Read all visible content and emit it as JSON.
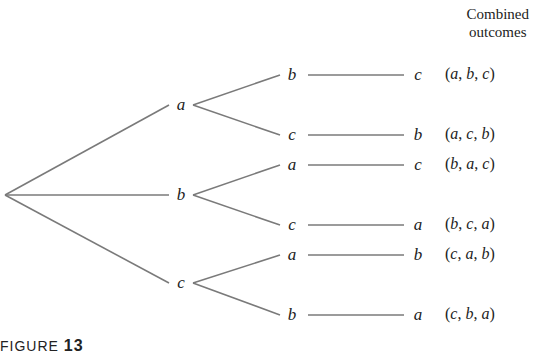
{
  "header": {
    "line1": "Combined",
    "line2": "outcomes"
  },
  "caption": {
    "prefix": "FIGURE",
    "number": "13"
  },
  "tree": {
    "root": {
      "x": 5,
      "y": 195
    },
    "level1": [
      {
        "label": "a",
        "x": 181,
        "y": 105
      },
      {
        "label": "b",
        "x": 181,
        "y": 195
      },
      {
        "label": "c",
        "x": 181,
        "y": 283
      }
    ],
    "level2": [
      {
        "label": "b",
        "x": 292,
        "y": 75,
        "parent": 0
      },
      {
        "label": "c",
        "x": 292,
        "y": 135,
        "parent": 0
      },
      {
        "label": "a",
        "x": 292,
        "y": 165,
        "parent": 1
      },
      {
        "label": "c",
        "x": 292,
        "y": 225,
        "parent": 1
      },
      {
        "label": "a",
        "x": 292,
        "y": 255,
        "parent": 2
      },
      {
        "label": "b",
        "x": 292,
        "y": 315,
        "parent": 2
      }
    ],
    "level3": [
      {
        "label": "c",
        "x": 418,
        "y": 75
      },
      {
        "label": "b",
        "x": 418,
        "y": 135
      },
      {
        "label": "c",
        "x": 418,
        "y": 165
      },
      {
        "label": "a",
        "x": 418,
        "y": 225
      },
      {
        "label": "b",
        "x": 418,
        "y": 255
      },
      {
        "label": "a",
        "x": 418,
        "y": 315
      }
    ],
    "outcomes": [
      {
        "text": "(a, b, c)",
        "parts": [
          "a",
          "b",
          "c"
        ]
      },
      {
        "text": "(a, c, b)",
        "parts": [
          "a",
          "c",
          "b"
        ]
      },
      {
        "text": "(b, a, c)",
        "parts": [
          "b",
          "a",
          "c"
        ]
      },
      {
        "text": "(b, c, a)",
        "parts": [
          "b",
          "c",
          "a"
        ]
      },
      {
        "text": "(c, a, b)",
        "parts": [
          "c",
          "a",
          "b"
        ]
      },
      {
        "text": "(c, b, a)",
        "parts": [
          "c",
          "b",
          "a"
        ]
      }
    ]
  },
  "colors": {
    "line": "#7a7a7a",
    "text": "#222222"
  }
}
